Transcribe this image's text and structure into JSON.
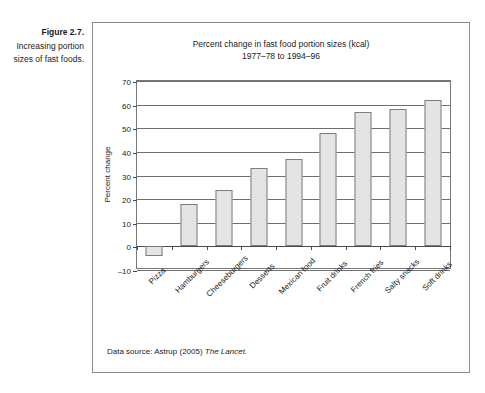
{
  "figure": {
    "caption_title": "Figure 2.7.",
    "caption_text": "Increasing portion sizes of fast foods.",
    "source_prefix": "Data source: Astrup (2005)",
    "source_journal": "The Lancet."
  },
  "chart_data": {
    "type": "bar",
    "title": "Percent change in fast food portion sizes (kcal)",
    "subtitle": "1977–78 to 1994–96",
    "xlabel": "",
    "ylabel": "Percent change",
    "ylim": [
      -10,
      70
    ],
    "yticks": [
      70,
      60,
      50,
      40,
      30,
      20,
      10,
      0,
      -10
    ],
    "ytick_labels": [
      "70",
      "60",
      "50",
      "40",
      "30",
      "20",
      "10",
      "0",
      "–10"
    ],
    "grid": true,
    "legend": "none",
    "categories": [
      "Pizza",
      "Hamburgers",
      "Cheeseburgers",
      "Desserts",
      "Mexican food",
      "Fruit drinks",
      "French fries",
      "Salty snacks",
      "Soft drinks"
    ],
    "values": [
      -4,
      18,
      24,
      33,
      37,
      48,
      57,
      58,
      62
    ],
    "bar_fill": "#e4e4e4",
    "bar_border": "#7d7d7d"
  }
}
